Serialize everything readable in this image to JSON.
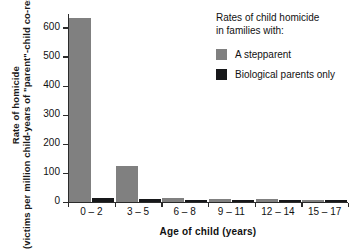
{
  "chart_data": {
    "type": "bar",
    "title": "",
    "xlabel": "Age of child (years)",
    "ylabel_main": "Rate of homicide",
    "ylabel_sub": "(victims per million child-years of \"parent\"-child co-residence)",
    "categories": [
      "0 – 2",
      "3 – 5",
      "6 – 8",
      "9 – 11",
      "12 – 14",
      "15 – 17"
    ],
    "series": [
      {
        "name": "A stepparent",
        "color": "#808080",
        "values": [
          633,
          123,
          13,
          12,
          11,
          8
        ]
      },
      {
        "name": "Biological parents only",
        "color": "#17181a",
        "values": [
          14,
          12,
          7,
          6,
          7,
          5
        ]
      }
    ],
    "ylim": [
      0,
      650
    ],
    "yticks": [
      0,
      100,
      200,
      300,
      400,
      500,
      600
    ],
    "ytick_labels": [
      "0",
      "100",
      "200",
      "300",
      "400",
      "500",
      "600"
    ],
    "grid": false,
    "legend_position": "top-right",
    "legend_title_line1": "Rates of child homicide",
    "legend_title_line2": "in families with:"
  },
  "legend": {
    "title_line1": "Rates of child homicide",
    "title_line2": "in families with:",
    "items": [
      {
        "label": "A stepparent",
        "color": "#808080"
      },
      {
        "label": "Biological parents only",
        "color": "#17181a"
      }
    ]
  },
  "axes": {
    "x_title": "Age of child (years)",
    "y_title_main": "Rate of homicide",
    "y_title_sub": "(victims per million child-years of \"parent\"-child co-residence)"
  }
}
